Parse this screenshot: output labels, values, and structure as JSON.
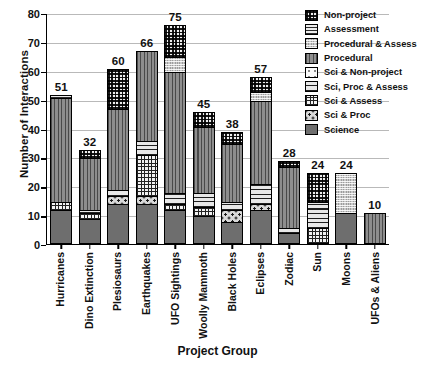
{
  "chart_data": {
    "type": "bar",
    "stacked": true,
    "title": "",
    "xlabel": "Project Group",
    "ylabel": "Number of Interactions",
    "ylim": [
      0,
      80
    ],
    "yticks": [
      0,
      10,
      20,
      30,
      40,
      50,
      60,
      70,
      80
    ],
    "grid": true,
    "legend_position": "top-right",
    "categories": [
      "Hurricanes",
      "Dino Extinction",
      "Plesiosaurs",
      "Earthquakes",
      "UFO Sightings",
      "Woolly Mammoth",
      "Black Holes",
      "Eclipses",
      "Zodiac",
      "Sun",
      "Moons",
      "UFOs & Aliens"
    ],
    "totals": [
      51,
      32,
      60,
      66,
      75,
      45,
      38,
      57,
      28,
      24,
      24,
      10
    ],
    "series": [
      {
        "name": "Science",
        "key": "science",
        "pattern": "p-science",
        "values": [
          11,
          8,
          13,
          13,
          11,
          9,
          7,
          11,
          3,
          0,
          10,
          0
        ]
      },
      {
        "name": "Sci & Proc",
        "key": "sciproc",
        "pattern": "p-sciproc",
        "values": [
          0,
          0,
          3,
          3,
          0,
          0,
          4,
          2,
          0,
          0,
          0,
          0
        ]
      },
      {
        "name": "Sci & Assess",
        "key": "sciassess",
        "pattern": "p-sciassess",
        "values": [
          3,
          2,
          0,
          14,
          2,
          3,
          0,
          0,
          0,
          5,
          0,
          0
        ]
      },
      {
        "name": "Sci, Proc & Assess",
        "key": "scipa",
        "pattern": "p-scipa",
        "values": [
          0,
          1,
          2,
          5,
          4,
          5,
          3,
          7,
          2,
          9,
          0,
          0
        ]
      },
      {
        "name": "Sci & Non-project",
        "key": "scinonproj",
        "pattern": "p-scinonproj",
        "values": [
          0,
          0,
          0,
          0,
          0,
          0,
          0,
          0,
          0,
          0,
          0,
          0
        ]
      },
      {
        "name": "Procedural",
        "key": "procedural",
        "pattern": "p-procedural",
        "values": [
          36,
          18,
          28,
          31,
          42,
          23,
          20,
          29,
          21,
          0,
          0,
          10
        ]
      },
      {
        "name": "Procedural & Assess",
        "key": "procassess",
        "pattern": "p-procassess",
        "values": [
          0,
          0,
          0,
          0,
          5,
          0,
          0,
          3,
          0,
          0,
          14,
          0
        ]
      },
      {
        "name": "Assessment",
        "key": "assessment",
        "pattern": "p-assessment",
        "values": [
          1,
          0,
          0,
          0,
          0,
          0,
          0,
          0,
          0,
          0,
          0,
          0
        ]
      },
      {
        "name": "Non-project",
        "key": "nonproject",
        "pattern": "p-nonproject",
        "values": [
          0,
          3,
          14,
          0,
          11,
          5,
          4,
          5,
          2,
          10,
          0,
          0
        ]
      }
    ],
    "legend_order": [
      {
        "name": "Non-project",
        "pattern": "p-nonproject"
      },
      {
        "name": "Assessment",
        "pattern": "p-assessment"
      },
      {
        "name": "Procedural & Assess",
        "pattern": "p-procassess"
      },
      {
        "name": "Procedural",
        "pattern": "p-procedural"
      },
      {
        "name": "Sci & Non-project",
        "pattern": "p-scinonproj"
      },
      {
        "name": "Sci, Proc & Assess",
        "pattern": "p-scipa"
      },
      {
        "name": "Sci & Assess",
        "pattern": "p-sciassess"
      },
      {
        "name": "Sci & Proc",
        "pattern": "p-sciproc"
      },
      {
        "name": "Science",
        "pattern": "p-science"
      }
    ]
  }
}
